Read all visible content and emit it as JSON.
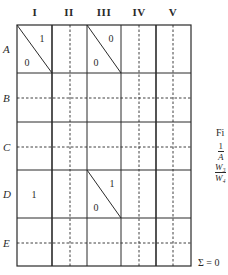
{
  "figure": {
    "column_headers": [
      "I",
      "II",
      "III",
      "IV",
      "V"
    ],
    "row_headers": [
      "A",
      "B",
      "C",
      "D",
      "E"
    ],
    "cells": [
      {
        "row": "A",
        "col": "I",
        "diagonal": true,
        "upper_value": "1",
        "lower_value": "0"
      },
      {
        "row": "A",
        "col": "III",
        "diagonal": true,
        "upper_value": "0",
        "lower_value": "0"
      },
      {
        "row": "D",
        "col": "I",
        "diagonal": false,
        "value": "1"
      },
      {
        "row": "D",
        "col": "III",
        "diagonal": true,
        "upper_value": "1",
        "lower_value": "0"
      }
    ],
    "cell_text": {
      "a1_upper": "1",
      "a1_lower": "0",
      "a3_upper": "0",
      "a3_lower": "0",
      "d1_value": "1",
      "d3_upper": "1",
      "d3_lower": "0"
    },
    "sum_label": "Σ = 0"
  },
  "caption_fragment": {
    "title": "Fi",
    "line1_numerator": "1",
    "line1_denominator": "A",
    "line2_numerator": "W₃",
    "line2_denominator": "W₄"
  },
  "colors": {
    "line": "#2a2a2a",
    "background": "#ffffff"
  }
}
